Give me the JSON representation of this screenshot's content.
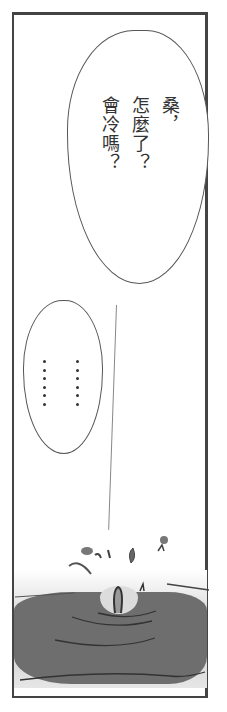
{
  "panel": {
    "border_color": "#444444",
    "background": "#ffffff"
  },
  "speech_bubble_1": {
    "columns": [
      "桑，",
      "怎麼了？",
      "會冷嗎？"
    ],
    "full_text": "桑，怎麼了？會冷嗎？"
  },
  "speech_bubble_2": {
    "columns": [
      "……",
      "……"
    ],
    "full_text": "…………"
  },
  "scene": {
    "description": "Water splash / ripples in dark water at bottom of panel",
    "water_color": "#6e6e6e"
  }
}
